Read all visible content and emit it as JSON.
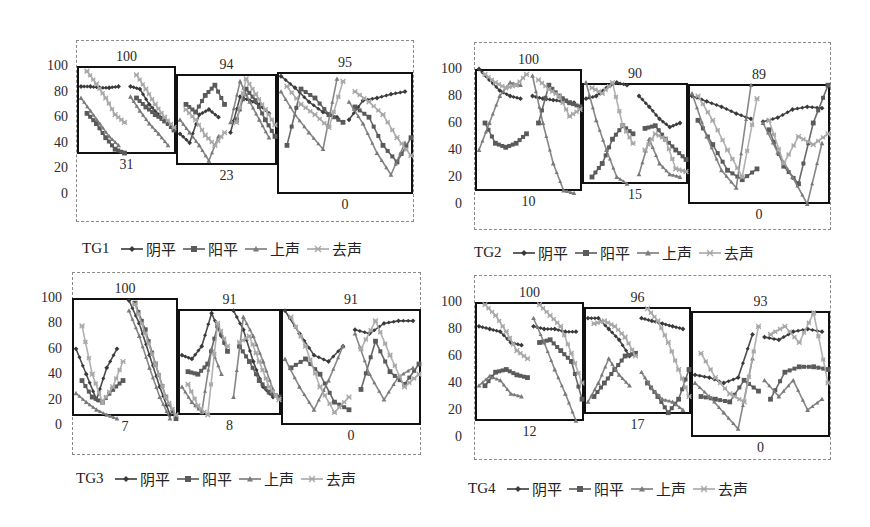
{
  "chart_data": [
    {
      "type": "line",
      "title": "TG1",
      "xlabel": "",
      "ylabel": "",
      "ylim": [
        0,
        100
      ],
      "yticks": [
        "100",
        "80",
        "60",
        "40",
        "20",
        "0"
      ],
      "legend": [
        "阴平",
        "阳平",
        "上声",
        "去声"
      ],
      "legend_position": "bottom",
      "boxes": [
        {
          "top": 100,
          "bottom": 31
        },
        {
          "top": 94,
          "bottom": 23
        },
        {
          "top": 95,
          "bottom": 0
        }
      ],
      "series": [
        {
          "name": "阴平",
          "values": [
            84,
            84,
            83,
            83,
            84,
            84,
            82,
            70,
            62,
            55,
            47,
            40,
            62,
            66,
            60,
            48,
            76,
            73,
            70,
            63,
            92,
            83,
            72,
            64,
            60,
            58,
            73,
            75,
            78,
            80
          ]
        },
        {
          "name": "阳平",
          "values": [
            63,
            55,
            44,
            35,
            32,
            75,
            68,
            62,
            57,
            50,
            70,
            64,
            77,
            85,
            70,
            58,
            82,
            73,
            58,
            45,
            38,
            82,
            75,
            62,
            56,
            68,
            60,
            38,
            25,
            44
          ]
        },
        {
          "name": "上声",
          "values": [
            75,
            65,
            55,
            45,
            38,
            76,
            65,
            55,
            47,
            38,
            58,
            48,
            38,
            26,
            45,
            56,
            88,
            72,
            58,
            44,
            80,
            62,
            48,
            35,
            90,
            72,
            55,
            32,
            15,
            40
          ]
        },
        {
          "name": "去声",
          "values": [
            96,
            86,
            75,
            62,
            56,
            93,
            82,
            70,
            60,
            52,
            66,
            58,
            46,
            38,
            48,
            56,
            90,
            78,
            66,
            54,
            84,
            70,
            62,
            52,
            88,
            80,
            72,
            62,
            44,
            30
          ]
        }
      ]
    },
    {
      "type": "line",
      "title": "TG2",
      "xlabel": "",
      "ylabel": "",
      "ylim": [
        0,
        100
      ],
      "yticks": [
        "100",
        "80",
        "60",
        "40",
        "20",
        "0"
      ],
      "legend": [
        "阴平",
        "阳平",
        "上声",
        "去声"
      ],
      "legend_position": "bottom",
      "boxes": [
        {
          "top": 100,
          "bottom": 10
        },
        {
          "top": 90,
          "bottom": 15
        },
        {
          "top": 89,
          "bottom": 0
        }
      ],
      "series": [
        {
          "name": "阴平",
          "values": [
            100,
            92,
            84,
            80,
            78,
            80,
            78,
            77,
            76,
            75,
            78,
            80,
            86,
            90,
            88,
            80,
            72,
            63,
            57,
            60,
            80,
            76,
            72,
            67,
            63,
            61,
            64,
            70,
            72,
            71
          ]
        },
        {
          "name": "阳平",
          "values": [
            60,
            45,
            42,
            45,
            52,
            60,
            88,
            80,
            75,
            72,
            20,
            30,
            48,
            58,
            52,
            56,
            58,
            48,
            40,
            33,
            62,
            44,
            25,
            18,
            26,
            55,
            28,
            15,
            60,
            88
          ]
        },
        {
          "name": "上声",
          "values": [
            40,
            60,
            80,
            90,
            88,
            95,
            60,
            30,
            10,
            8,
            90,
            62,
            40,
            20,
            15,
            22,
            48,
            30,
            22,
            20,
            82,
            50,
            25,
            12,
            88,
            60,
            38,
            20,
            0,
            45
          ]
        },
        {
          "name": "去声",
          "values": [
            96,
            90,
            86,
            88,
            96,
            92,
            85,
            80,
            65,
            70,
            86,
            82,
            90,
            58,
            45,
            40,
            52,
            48,
            26,
            24,
            80,
            62,
            40,
            20,
            78,
            62,
            30,
            50,
            44,
            52
          ]
        }
      ]
    },
    {
      "type": "line",
      "title": "TG3",
      "xlabel": "",
      "ylabel": "",
      "ylim": [
        0,
        100
      ],
      "yticks": [
        "100",
        "80",
        "60",
        "40",
        "20",
        "0"
      ],
      "legend": [
        "阴平",
        "阳平",
        "上声",
        "去声"
      ],
      "legend_position": "bottom",
      "boxes": [
        {
          "top": 100,
          "bottom": 7
        },
        {
          "top": 91,
          "bottom": 8
        },
        {
          "top": 91,
          "bottom": 0
        }
      ],
      "series": [
        {
          "name": "阴平",
          "values": [
            60,
            40,
            20,
            45,
            60,
            98,
            80,
            55,
            30,
            8,
            55,
            52,
            62,
            88,
            70,
            90,
            75,
            50,
            30,
            22,
            90,
            72,
            55,
            50,
            62,
            75,
            72,
            80,
            82,
            82
          ]
        },
        {
          "name": "阳平",
          "values": [
            35,
            22,
            18,
            28,
            35,
            96,
            75,
            48,
            22,
            5,
            42,
            40,
            48,
            78,
            58,
            62,
            50,
            35,
            26,
            22,
            45,
            52,
            40,
            18,
            12,
            28,
            66,
            42,
            32,
            48
          ]
        },
        {
          "name": "上声",
          "values": [
            25,
            18,
            12,
            8,
            5,
            90,
            70,
            45,
            22,
            5,
            30,
            18,
            10,
            60,
            40,
            22,
            85,
            70,
            50,
            28,
            52,
            30,
            12,
            35,
            62,
            72,
            40,
            20,
            38,
            45
          ]
        },
        {
          "name": "去声",
          "values": [
            78,
            40,
            18,
            30,
            50,
            95,
            72,
            48,
            22,
            8,
            32,
            15,
            8,
            80,
            62,
            65,
            70,
            50,
            30,
            20,
            85,
            62,
            30,
            10,
            22,
            60,
            82,
            55,
            30,
            40
          ]
        }
      ]
    },
    {
      "type": "line",
      "title": "TG4",
      "xlabel": "",
      "ylabel": "",
      "ylim": [
        0,
        100
      ],
      "yticks": [
        "100",
        "80",
        "60",
        "40",
        "20",
        "0"
      ],
      "legend": [
        "阴平",
        "阳平",
        "上声",
        "去声"
      ],
      "legend_position": "bottom",
      "boxes": [
        {
          "top": 100,
          "bottom": 12
        },
        {
          "top": 96,
          "bottom": 17
        },
        {
          "top": 93,
          "bottom": 0
        }
      ],
      "series": [
        {
          "name": "阴平",
          "values": [
            82,
            80,
            78,
            70,
            68,
            82,
            80,
            80,
            78,
            78,
            88,
            88,
            80,
            72,
            60,
            88,
            86,
            84,
            82,
            80,
            46,
            44,
            40,
            44,
            76,
            74,
            72,
            78,
            80,
            78
          ]
        },
        {
          "name": "阳平",
          "values": [
            38,
            48,
            50,
            46,
            44,
            70,
            72,
            64,
            56,
            28,
            30,
            40,
            50,
            60,
            62,
            40,
            30,
            18,
            28,
            50,
            30,
            28,
            26,
            42,
            34,
            28,
            48,
            52,
            52,
            50
          ]
        },
        {
          "name": "上声",
          "values": [
            38,
            45,
            42,
            32,
            30,
            88,
            70,
            50,
            32,
            12,
            26,
            40,
            58,
            46,
            38,
            48,
            36,
            28,
            26,
            20,
            40,
            30,
            18,
            6,
            58,
            42,
            30,
            42,
            20,
            28
          ]
        },
        {
          "name": "去声",
          "values": [
            98,
            90,
            78,
            64,
            58,
            98,
            90,
            82,
            62,
            40,
            84,
            86,
            82,
            74,
            60,
            95,
            86,
            70,
            50,
            30,
            62,
            44,
            32,
            26,
            82,
            76,
            82,
            70,
            92,
            40
          ]
        }
      ]
    }
  ],
  "series_styles": [
    {
      "name": "阴平",
      "color": "#3a3a3a",
      "marker": "diamond"
    },
    {
      "name": "阳平",
      "color": "#5a5a5a",
      "marker": "square"
    },
    {
      "name": "上声",
      "color": "#7a7a7a",
      "marker": "triangle"
    },
    {
      "name": "去声",
      "color": "#a8a8a8",
      "marker": "star"
    }
  ],
  "legends": [
    {
      "title": "TG1",
      "items": [
        "阴平",
        "阳平",
        "上声",
        "去声"
      ]
    },
    {
      "title": "TG2",
      "items": [
        "阴平",
        "阳平",
        "上声",
        "去声"
      ]
    },
    {
      "title": "TG3",
      "items": [
        "阴平",
        "阳平",
        "上声",
        "去声"
      ]
    },
    {
      "title": "TG4",
      "items": [
        "阴平",
        "阳平",
        "上声",
        "去声"
      ]
    }
  ]
}
